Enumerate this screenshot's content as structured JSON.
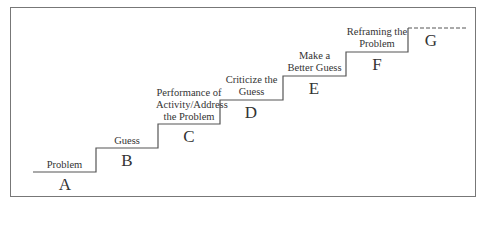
{
  "diagram": {
    "type": "staircase",
    "steps": [
      {
        "letter": "A",
        "label_lines": [
          "Problem"
        ]
      },
      {
        "letter": "B",
        "label_lines": [
          "Guess"
        ]
      },
      {
        "letter": "C",
        "label_lines": [
          "Performance of",
          "Activity/Address",
          "the Problem"
        ]
      },
      {
        "letter": "D",
        "label_lines": [
          "Criticize the",
          "Guess"
        ]
      },
      {
        "letter": "E",
        "label_lines": [
          "Make a",
          "Better Guess"
        ]
      },
      {
        "letter": "F",
        "label_lines": [
          "Reframing the",
          "Problem"
        ]
      },
      {
        "letter": "G",
        "label_lines": []
      }
    ],
    "line_color": "#555555"
  }
}
